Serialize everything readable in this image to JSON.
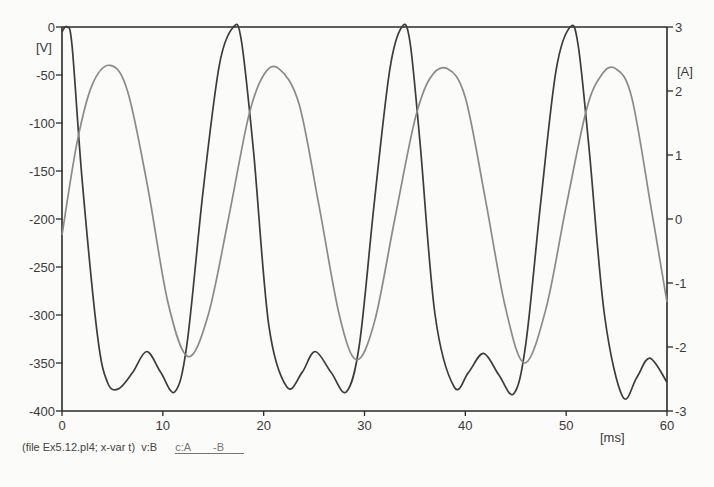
{
  "chart_data": {
    "type": "line",
    "title": "",
    "xlabel": "[ms]",
    "ylabel": "[V]",
    "y2label": "[A]",
    "xlim": [
      0,
      60
    ],
    "ylim": [
      -400,
      0
    ],
    "y2lim": [
      -3,
      3
    ],
    "xticks": [
      0,
      10,
      20,
      30,
      40,
      50,
      60
    ],
    "yticks": [
      0,
      -50,
      -100,
      -150,
      -200,
      -250,
      -300,
      -350,
      -400
    ],
    "y2ticks": [
      3,
      2,
      1,
      0,
      -1,
      -2,
      -3
    ],
    "grid": false,
    "series": [
      {
        "name": "v:B",
        "axis": "left",
        "color": "#3c3c3c",
        "x": [
          0,
          0.5,
          1.0,
          2.0,
          3.5,
          4.5,
          5.6,
          7.0,
          8.4,
          9.8,
          11.2,
          12.4,
          14.0,
          15.6,
          17.0,
          17.8,
          19.0,
          20.5,
          22.3,
          23.8,
          25.1,
          26.7,
          28.2,
          29.5,
          31.0,
          32.5,
          33.7,
          34.5,
          35.5,
          37.0,
          38.9,
          40.3,
          41.8,
          43.3,
          44.8,
          46.0,
          47.5,
          49.0,
          50.4,
          51.2,
          52.3,
          53.8,
          55.6,
          57.0,
          58.3,
          60.0
        ],
        "y": [
          -5,
          0,
          -20,
          -160,
          -320,
          -370,
          -377,
          -360,
          -338,
          -360,
          -380,
          -330,
          -170,
          -40,
          0,
          -15,
          -130,
          -310,
          -375,
          -360,
          -338,
          -360,
          -380,
          -330,
          -180,
          -45,
          0,
          -15,
          -120,
          -300,
          -375,
          -360,
          -340,
          -362,
          -382,
          -330,
          -180,
          -45,
          0,
          -20,
          -130,
          -300,
          -385,
          -365,
          -345,
          -370
        ]
      },
      {
        "name": "c:A -B",
        "axis": "right",
        "color": "#8a8a8a",
        "x": [
          0,
          1.5,
          3.0,
          4.8,
          6.5,
          8.5,
          10.5,
          12.5,
          14.5,
          16.5,
          18.5,
          20.0,
          21.5,
          23.5,
          25.5,
          27.5,
          29.2,
          31.0,
          33.0,
          35.0,
          36.5,
          38.2,
          40.0,
          42.0,
          44.0,
          45.9,
          48.0,
          50.0,
          52.0,
          53.5,
          54.9,
          56.5,
          58.5,
          60.0
        ],
        "y": [
          -0.25,
          1.2,
          2.1,
          2.4,
          2.0,
          0.5,
          -1.3,
          -2.15,
          -1.5,
          0.0,
          1.6,
          2.25,
          2.35,
          1.8,
          0.2,
          -1.5,
          -2.2,
          -1.6,
          0.0,
          1.55,
          2.2,
          2.35,
          1.9,
          0.3,
          -1.4,
          -2.25,
          -1.4,
          0.2,
          1.7,
          2.25,
          2.35,
          1.9,
          0.1,
          -1.3
        ]
      }
    ]
  },
  "axes": {
    "left_unit": "[V]",
    "right_unit": "[A]",
    "x_unit": "[ms]"
  },
  "footer": {
    "file_info": "(file Ex5.12.pl4; x-var t)",
    "series_v": "v:B",
    "series_c": "c:A",
    "series_c2": "-B"
  }
}
